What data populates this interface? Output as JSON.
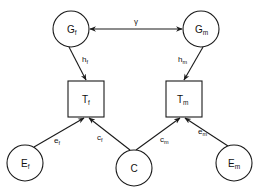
{
  "diagram": {
    "type": "path-diagram",
    "colors": {
      "stroke": "#1a1a1a",
      "background": "#ffffff"
    },
    "nodes": {
      "Gf": {
        "shape": "circle",
        "main": "G",
        "sub": "f"
      },
      "Gm": {
        "shape": "circle",
        "main": "G",
        "sub": "m"
      },
      "Tf": {
        "shape": "square",
        "main": "T",
        "sub": "f"
      },
      "Tm": {
        "shape": "square",
        "main": "T",
        "sub": "m"
      },
      "Ef": {
        "shape": "circle",
        "main": "E",
        "sub": "f"
      },
      "C": {
        "shape": "circle",
        "main": "C",
        "sub": ""
      },
      "Em": {
        "shape": "circle",
        "main": "E",
        "sub": "m"
      }
    },
    "edges": {
      "gamma": {
        "from": "Gf",
        "to": "Gm",
        "bidirectional": true,
        "label": "γ",
        "sub": ""
      },
      "hf": {
        "from": "Gf",
        "to": "Tf",
        "main": "h",
        "sub": "f"
      },
      "hm": {
        "from": "Gm",
        "to": "Tm",
        "main": "h",
        "sub": "m"
      },
      "ef": {
        "from": "Ef",
        "to": "Tf",
        "main": "e",
        "sub": "f"
      },
      "cf": {
        "from": "C",
        "to": "Tf",
        "main": "c",
        "sub": "f"
      },
      "cm": {
        "from": "C",
        "to": "Tm",
        "main": "c",
        "sub": "m"
      },
      "em": {
        "from": "Em",
        "to": "Tm",
        "main": "e",
        "sub": "m"
      }
    }
  }
}
